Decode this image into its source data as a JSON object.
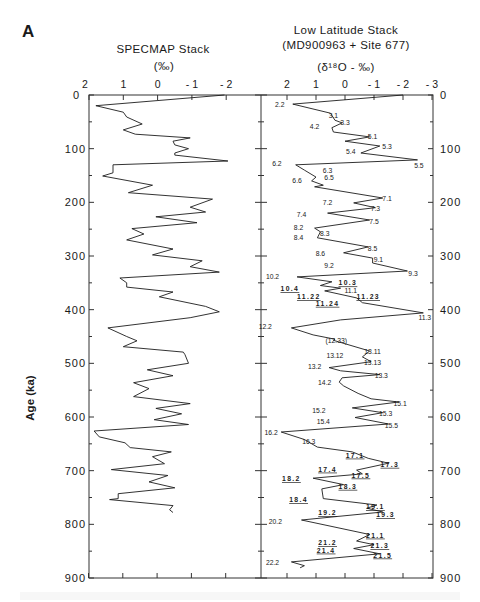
{
  "figure": {
    "panel_letter": "A",
    "caption_fragment": "",
    "left_panel": {
      "title": "SPECMAP Stack",
      "units": "(‰)",
      "x_ticks": [
        "2",
        "1",
        "0",
        "- 1",
        "- 2"
      ]
    },
    "right_panel": {
      "title_line1": "Low  Latitude  Stack",
      "title_line2": "(MD900963  +  Site  677)",
      "units": "(δ¹⁸O -  ‰)",
      "x_ticks": [
        "2",
        "1",
        "0",
        "- 1",
        "- 2",
        "- 3"
      ]
    },
    "y_axis": {
      "label": "Age  (ka)",
      "ticks": [
        "0",
        "100",
        "200",
        "300",
        "400",
        "500",
        "600",
        "700",
        "800",
        "900"
      ]
    }
  },
  "chart_data": [
    {
      "type": "line",
      "title": "SPECMAP Stack",
      "xlabel": "(‰)",
      "ylabel": "Age (ka)",
      "orientation": "vertical (age on y-axis, increasing downward; x-axis reversed)",
      "xlim": [
        2,
        -2
      ],
      "ylim": [
        0,
        900
      ],
      "grid": false,
      "series": [
        {
          "name": "SPECMAP",
          "points": [
            [
              0,
              -1.95
            ],
            [
              20,
              1.8
            ],
            [
              32,
              1.0
            ],
            [
              41,
              0.9
            ],
            [
              54,
              0.45
            ],
            [
              65,
              1.0
            ],
            [
              73,
              0.65
            ],
            [
              80,
              -0.95
            ],
            [
              86,
              -0.45
            ],
            [
              93,
              -0.5
            ],
            [
              100,
              -0.9
            ],
            [
              108,
              -0.5
            ],
            [
              112,
              -0.5
            ],
            [
              123,
              -2.05
            ],
            [
              130,
              1.3
            ],
            [
              145,
              1.3
            ],
            [
              151,
              1.6
            ],
            [
              168,
              0.15
            ],
            [
              182,
              0.85
            ],
            [
              194,
              -1.6
            ],
            [
              209,
              -0.95
            ],
            [
              218,
              -1.4
            ],
            [
              227,
              0.05
            ],
            [
              238,
              -1.15
            ],
            [
              249,
              0.75
            ],
            [
              259,
              0.4
            ],
            [
              270,
              0.9
            ],
            [
              287,
              -0.45
            ],
            [
              298,
              0.15
            ],
            [
              309,
              -1.3
            ],
            [
              320,
              -0.95
            ],
            [
              330,
              -1.8
            ],
            [
              341,
              1.1
            ],
            [
              350,
              0.9
            ],
            [
              358,
              0.9
            ],
            [
              367,
              -0.45
            ],
            [
              376,
              -0.05
            ],
            [
              394,
              -1.4
            ],
            [
              404,
              -1.8
            ],
            [
              415,
              -0.95
            ],
            [
              434,
              1.45
            ],
            [
              450,
              0.9
            ],
            [
              458,
              0.6
            ],
            [
              469,
              1.0
            ],
            [
              479,
              -0.75
            ],
            [
              484,
              -0.8
            ],
            [
              500,
              -0.9
            ],
            [
              512,
              0.3
            ],
            [
              523,
              -0.45
            ],
            [
              536,
              0.7
            ],
            [
              547,
              0.25
            ],
            [
              562,
              0.7
            ],
            [
              575,
              -0.95
            ],
            [
              584,
              0.05
            ],
            [
              594,
              -0.7
            ],
            [
              605,
              0.1
            ],
            [
              614,
              -0.9
            ],
            [
              626,
              1.85
            ],
            [
              637,
              1.7
            ],
            [
              648,
              0.95
            ],
            [
              657,
              0.8
            ],
            [
              665,
              -0.4
            ],
            [
              674,
              0.15
            ],
            [
              687,
              -0.2
            ],
            [
              698,
              1.35
            ],
            [
              709,
              -0.3
            ],
            [
              721,
              0.25
            ],
            [
              732,
              -0.5
            ],
            [
              743,
              1.15
            ],
            [
              752,
              1.15
            ],
            [
              754,
              1.4
            ],
            [
              765,
              -0.45
            ],
            [
              773,
              -0.35
            ],
            [
              778,
              -0.45
            ]
          ]
        }
      ]
    },
    {
      "type": "line",
      "title": "Low Latitude Stack (MD900963 + Site 677)",
      "xlabel": "(δ¹⁸O - ‰)",
      "ylabel": "Age (ka)",
      "orientation": "vertical (age on y-axis, increasing downward; x-axis reversed)",
      "xlim": [
        2,
        -3
      ],
      "ylim": [
        0,
        900
      ],
      "grid": false,
      "series": [
        {
          "name": "Low Latitude Stack",
          "points": [
            [
              0,
              -2.0
            ],
            [
              17,
              1.8
            ],
            [
              34,
              0.5
            ],
            [
              47,
              0.35
            ],
            [
              52,
              0.1
            ],
            [
              61,
              0.45
            ],
            [
              69,
              0.4
            ],
            [
              78,
              -0.85
            ],
            [
              86,
              0.0
            ],
            [
              95,
              -1.2
            ],
            [
              108,
              -0.55
            ],
            [
              121,
              -2.5
            ],
            [
              130,
              1.7
            ],
            [
              140,
              1.4
            ],
            [
              153,
              1.0
            ],
            [
              160,
              1.15
            ],
            [
              168,
              0.75
            ],
            [
              171,
              1.05
            ],
            [
              192,
              -1.3
            ],
            [
              201,
              -0.3
            ],
            [
              210,
              -1.05
            ],
            [
              220,
              0.6
            ],
            [
              233,
              -0.85
            ],
            [
              248,
              1.05
            ],
            [
              255,
              0.85
            ],
            [
              266,
              0.95
            ],
            [
              283,
              -0.8
            ],
            [
              294,
              0.05
            ],
            [
              304,
              -0.95
            ],
            [
              313,
              -0.95
            ],
            [
              328,
              -2.15
            ],
            [
              339,
              1.65
            ],
            [
              348,
              0.45
            ],
            [
              355,
              0.85
            ],
            [
              360,
              0.15
            ],
            [
              365,
              0.7
            ],
            [
              378,
              -0.4
            ],
            [
              387,
              -0.6
            ],
            [
              406,
              -2.7
            ],
            [
              419,
              0.15
            ],
            [
              434,
              1.85
            ],
            [
              447,
              1.1
            ],
            [
              455,
              0.35
            ],
            [
              457,
              0.4
            ],
            [
              477,
              -0.85
            ],
            [
              488,
              -0.6
            ],
            [
              497,
              -0.9
            ],
            [
              508,
              0.55
            ],
            [
              514,
              0.15
            ],
            [
              521,
              -1.2
            ],
            [
              527,
              0.1
            ],
            [
              535,
              0.2
            ],
            [
              542,
              0.05
            ],
            [
              556,
              -0.45
            ],
            [
              566,
              -0.9
            ],
            [
              572,
              -1.85
            ],
            [
              583,
              -0.25
            ],
            [
              592,
              -1.3
            ],
            [
              601,
              -0.35
            ],
            [
              613,
              -1.5
            ],
            [
              628,
              2.2
            ],
            [
              642,
              1.4
            ],
            [
              656,
              0.95
            ],
            [
              665,
              -0.25
            ],
            [
              677,
              -0.8
            ],
            [
              686,
              -1.5
            ],
            [
              699,
              -0.4
            ],
            [
              706,
              -0.6
            ],
            [
              714,
              1.1
            ],
            [
              726,
              0.05
            ],
            [
              734,
              0.8
            ],
            [
              752,
              0.75
            ],
            [
              764,
              -1.1
            ],
            [
              770,
              -0.75
            ],
            [
              777,
              -1.3
            ],
            [
              792,
              1.5
            ],
            [
              819,
              -0.85
            ],
            [
              831,
              -0.4
            ],
            [
              838,
              -1.0
            ],
            [
              845,
              -0.3
            ],
            [
              855,
              -1.2
            ],
            [
              870,
              1.85
            ],
            [
              877,
              1.4
            ],
            [
              881,
              1.55
            ]
          ]
        }
      ],
      "annotations": [
        {
          "text": "2.2",
          "x": 2.25,
          "age": 18,
          "underline": false
        },
        {
          "text": "3.1",
          "x": 0.4,
          "age": 39,
          "underline": false
        },
        {
          "text": "3.3",
          "x": 0.0,
          "age": 52,
          "underline": false
        },
        {
          "text": "4.2",
          "x": 1.05,
          "age": 60,
          "underline": false
        },
        {
          "text": "5.1",
          "x": -0.95,
          "age": 79,
          "underline": false
        },
        {
          "text": "5.3",
          "x": -1.45,
          "age": 96,
          "underline": false
        },
        {
          "text": "5.4",
          "x": -0.2,
          "age": 107,
          "underline": false
        },
        {
          "text": "5.5",
          "x": -2.55,
          "age": 132,
          "underline": false
        },
        {
          "text": "6.2",
          "x": 2.35,
          "age": 129,
          "underline": false
        },
        {
          "text": "6.3",
          "x": 0.6,
          "age": 142,
          "underline": false
        },
        {
          "text": "6.5",
          "x": 0.55,
          "age": 154,
          "underline": false
        },
        {
          "text": "6.6",
          "x": 1.65,
          "age": 161,
          "underline": false
        },
        {
          "text": "7.1",
          "x": -1.45,
          "age": 193,
          "underline": false
        },
        {
          "text": "7.2",
          "x": 0.6,
          "age": 202,
          "underline": false
        },
        {
          "text": "7.3",
          "x": -1.05,
          "age": 213,
          "underline": false
        },
        {
          "text": "7.4",
          "x": 1.5,
          "age": 223,
          "underline": false
        },
        {
          "text": "7.5",
          "x": -1.0,
          "age": 236,
          "underline": false
        },
        {
          "text": "8.2",
          "x": 1.6,
          "age": 248,
          "underline": false
        },
        {
          "text": "8.3",
          "x": 0.7,
          "age": 258,
          "underline": false
        },
        {
          "text": "8.4",
          "x": 1.6,
          "age": 266,
          "underline": false
        },
        {
          "text": "8.5",
          "x": -0.95,
          "age": 286,
          "underline": false
        },
        {
          "text": "8.6",
          "x": 0.85,
          "age": 296,
          "underline": false
        },
        {
          "text": "9.1",
          "x": -1.15,
          "age": 308,
          "underline": false
        },
        {
          "text": "9.2",
          "x": 0.55,
          "age": 319,
          "underline": false
        },
        {
          "text": "9.3",
          "x": -2.35,
          "age": 333,
          "underline": false
        },
        {
          "text": "10.2",
          "x": 2.5,
          "age": 339,
          "underline": false
        },
        {
          "text": "10.3",
          "x": -0.1,
          "age": 351,
          "underline": true
        },
        {
          "text": "10.4",
          "x": 1.9,
          "age": 362,
          "underline": true
        },
        {
          "text": "11.1",
          "x": -0.2,
          "age": 366,
          "underline": false
        },
        {
          "text": "11.22",
          "x": 1.25,
          "age": 377,
          "underline": true
        },
        {
          "text": "11.23",
          "x": -0.8,
          "age": 377,
          "underline": true
        },
        {
          "text": "11.24",
          "x": 0.6,
          "age": 389,
          "underline": true
        },
        {
          "text": "11.3",
          "x": -2.75,
          "age": 416,
          "underline": false
        },
        {
          "text": "12.2",
          "x": 2.75,
          "age": 433,
          "underline": false
        },
        {
          "text": "(12.33)",
          "x": 0.3,
          "age": 458,
          "underline": false
        },
        {
          "text": "13.11",
          "x": -0.95,
          "age": 479,
          "underline": false
        },
        {
          "text": "13.12",
          "x": 0.35,
          "age": 486,
          "underline": false
        },
        {
          "text": "13.13",
          "x": -0.95,
          "age": 499,
          "underline": false
        },
        {
          "text": "13.2",
          "x": 1.05,
          "age": 506,
          "underline": false
        },
        {
          "text": "13.3",
          "x": -1.25,
          "age": 524,
          "underline": false
        },
        {
          "text": "14.2",
          "x": 0.7,
          "age": 537,
          "underline": false
        },
        {
          "text": "15.1",
          "x": -1.9,
          "age": 575,
          "underline": false
        },
        {
          "text": "15.2",
          "x": 0.9,
          "age": 588,
          "underline": false
        },
        {
          "text": "15.3",
          "x": -1.4,
          "age": 595,
          "underline": false
        },
        {
          "text": "15.4",
          "x": 0.75,
          "age": 609,
          "underline": false
        },
        {
          "text": "15.5",
          "x": -1.6,
          "age": 616,
          "underline": false
        },
        {
          "text": "16.2",
          "x": 2.55,
          "age": 630,
          "underline": false
        },
        {
          "text": "16.3",
          "x": 1.25,
          "age": 646,
          "underline": false
        },
        {
          "text": "17.1",
          "x": -0.35,
          "age": 672,
          "underline": true
        },
        {
          "text": "17.3",
          "x": -1.55,
          "age": 689,
          "underline": true
        },
        {
          "text": "17.4",
          "x": 0.6,
          "age": 698,
          "underline": true
        },
        {
          "text": "17.5",
          "x": -0.55,
          "age": 709,
          "underline": true
        },
        {
          "text": "18.2",
          "x": 1.85,
          "age": 716,
          "underline": true
        },
        {
          "text": "18.3",
          "x": -0.1,
          "age": 730,
          "underline": true
        },
        {
          "text": "18.4",
          "x": 1.6,
          "age": 755,
          "underline": true
        },
        {
          "text": "19.1",
          "x": -1.05,
          "age": 768,
          "underline": true
        },
        {
          "text": "19.2",
          "x": 0.6,
          "age": 779,
          "underline": true
        },
        {
          "text": "19.3",
          "x": -1.4,
          "age": 783,
          "underline": true
        },
        {
          "text": "20.2",
          "x": 2.4,
          "age": 795,
          "underline": false
        },
        {
          "text": "21.1",
          "x": -1.05,
          "age": 821,
          "underline": true
        },
        {
          "text": "21.2",
          "x": 0.6,
          "age": 835,
          "underline": true
        },
        {
          "text": "21.3",
          "x": -1.2,
          "age": 841,
          "underline": true
        },
        {
          "text": "21.4",
          "x": 0.65,
          "age": 849,
          "underline": true
        },
        {
          "text": "21.5",
          "x": -1.3,
          "age": 858,
          "underline": true
        },
        {
          "text": "22.2",
          "x": 2.5,
          "age": 872,
          "underline": false
        }
      ]
    }
  ]
}
